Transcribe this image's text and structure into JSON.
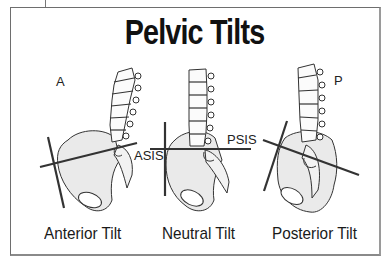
{
  "title": "Pelvic Tilts",
  "direction_labels": {
    "anterior": "A",
    "posterior": "P"
  },
  "landmarks": {
    "asis": "ASIS",
    "psis": "PSIS"
  },
  "panels": [
    {
      "caption": "Anterior Tilt"
    },
    {
      "caption": "Neutral Tilt"
    },
    {
      "caption": "Posterior Tilt"
    }
  ],
  "colors": {
    "bone_fill": "#e9e9e9",
    "outline": "#333333",
    "axis_line": "#333333"
  }
}
